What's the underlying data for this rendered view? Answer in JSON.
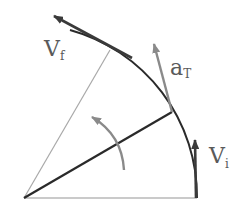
{
  "diagram": {
    "type": "circular-motion-velocity-diagram",
    "labels": {
      "v_final": {
        "main": "V",
        "sub": "f"
      },
      "a_tangential": {
        "main": "a",
        "sub": "T"
      },
      "v_initial": {
        "main": "V",
        "sub": "i"
      }
    },
    "colors": {
      "dark_stroke": "#2a2a2a",
      "gray_stroke": "#8a8a8a",
      "light_stroke": "#b0b0b0",
      "label": "#5a5a5a",
      "background": "#ffffff"
    }
  }
}
